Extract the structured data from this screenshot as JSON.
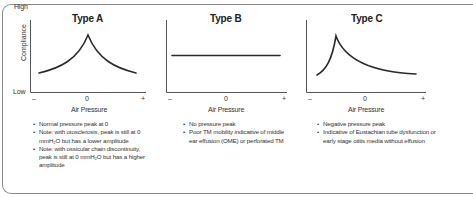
{
  "axes": {
    "y_high": "High",
    "y_low": "Low",
    "y_label": "Compliance",
    "x_label": "Air Pressure",
    "x_ticks": [
      "–",
      "0",
      "+"
    ]
  },
  "panels": [
    {
      "title": "Type A",
      "curve": "peak-at-zero",
      "notes": [
        "Normal pressure peak at 0",
        "Note: with otosclerosis, peak is still at 0 mmH₂O but has a lower amplitude",
        "Note: with ossicular chain discontinuity, peak is still at 0 mmH₂O but has a higher amplitude"
      ]
    },
    {
      "title": "Type B",
      "curve": "flat",
      "notes": [
        "No pressure peak",
        "Poor TM mobility indicative of middle ear effusion (OME) or perforated TM"
      ]
    },
    {
      "title": "Type C",
      "curve": "peak-at-negative-pressure",
      "notes": [
        "Negative pressure peak",
        "Indicative of Eustachian tube dysfunction or early stage otitis media without effusion"
      ]
    }
  ],
  "colors": {
    "line": "#2a2a2a",
    "axis": "#555555",
    "frame": "#8a8a8a"
  }
}
